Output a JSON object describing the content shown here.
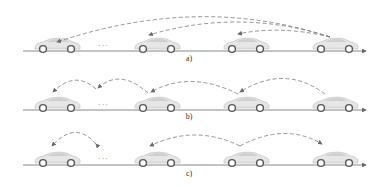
{
  "figure": {
    "panels": [
      {
        "id": "a",
        "label": "a)",
        "dots": "···",
        "arrows": [
          {
            "from": 3,
            "to": 0,
            "style": "dashed"
          },
          {
            "from": 3,
            "to": 1,
            "style": "dashed"
          },
          {
            "from": 3,
            "to": 2,
            "style": "dashed"
          }
        ]
      },
      {
        "id": "b",
        "label": "b)",
        "dots": "···",
        "arrows": [
          {
            "from": 3,
            "to": 2,
            "style": "dashed"
          },
          {
            "from": 2,
            "to": 1,
            "style": "dashed"
          },
          {
            "from": 1,
            "to": "dots",
            "style": "dashed"
          },
          {
            "from": "dots",
            "to": 0,
            "style": "dashed"
          }
        ]
      },
      {
        "id": "c",
        "label": "c)",
        "dots": "···",
        "arrows": [
          {
            "from": 0,
            "to": "dots",
            "style": "dashed",
            "bidirectional": true
          },
          {
            "from": 2,
            "to": 1,
            "style": "dashed"
          },
          {
            "from": 2,
            "to": 3,
            "style": "dashed"
          }
        ]
      }
    ],
    "cars_per_row": 4,
    "colors": {
      "axis": "#6a6a6a",
      "arrow": "#7a7a7a",
      "car_body": "#e4e4e4",
      "car_outline": "#b5b5b5",
      "wheel": "#555555"
    }
  }
}
